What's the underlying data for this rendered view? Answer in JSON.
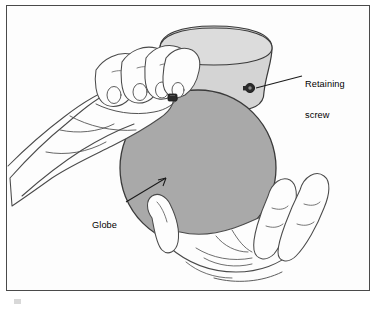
{
  "figure": {
    "type": "technical-line-illustration",
    "background_color": "#ffffff",
    "frame": {
      "border_color": "#4a4a4a",
      "fill": "#fdfdfd"
    }
  },
  "parts": {
    "globe": {
      "name": "Globe",
      "shape": "sphere",
      "fill_color": "#a9a9a9",
      "outline_color": "#3a3a3a",
      "center_x": 198,
      "center_y": 168,
      "radius": 78
    },
    "housing": {
      "name": "Fixture housing",
      "shape": "flared-canopy",
      "fill_color": "#d4d4d4",
      "outline_color": "#3a3a3a"
    },
    "retaining_screw": {
      "name": "Retaining screw",
      "count": 2,
      "fill_color": "#2b2b2b",
      "positions": [
        {
          "x": 250,
          "y": 88
        },
        {
          "x": 172,
          "y": 98
        }
      ]
    },
    "hands": {
      "upper_left": {
        "name": "Upper left hand",
        "fingers": 4,
        "stroke": "#4a4a4a"
      },
      "lower_right": {
        "name": "Lower cupping hand",
        "fingers": 4,
        "stroke": "#4a4a4a"
      }
    }
  },
  "labels": [
    {
      "id": "retaining-screw",
      "text": "Retaining\nscrew",
      "line1": "Retaining",
      "line2": "screw",
      "color": "#000000",
      "x": 305,
      "y": 58,
      "leader_from": {
        "x": 302,
        "y": 76
      },
      "leader_to": {
        "x": 256,
        "y": 88
      }
    },
    {
      "id": "globe",
      "text": "Globe",
      "line1": "Globe",
      "color": "#000000",
      "x": 92,
      "y": 199,
      "leader_from": {
        "x": 126,
        "y": 202
      },
      "leader_to": {
        "x": 166,
        "y": 178
      }
    }
  ],
  "colors": {
    "globe_gray": "#a9a9a9",
    "housing_gray": "#d4d4d4",
    "outline": "#3a3a3a",
    "line_art": "#4a4a4a",
    "text": "#000000",
    "frame": "#4a4a4a"
  }
}
